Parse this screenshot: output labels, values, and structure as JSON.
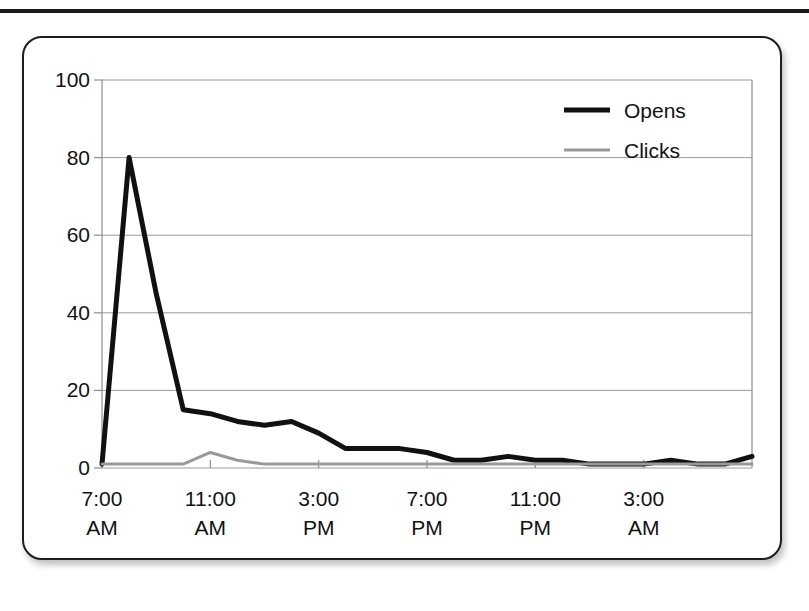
{
  "card": {
    "title": ""
  },
  "legend": {
    "position": "top-right",
    "entries": [
      {
        "label": "Opens",
        "color": "#111111",
        "swatch": "line-swatch-opens"
      },
      {
        "label": "Clicks",
        "color": "#999999",
        "swatch": "line-swatch-clicks"
      }
    ]
  },
  "chart_data": {
    "type": "line",
    "title": "",
    "xlabel": "",
    "ylabel": "",
    "grid": true,
    "legend_position": "top-right",
    "ylim": [
      0,
      100
    ],
    "yticks": [
      0,
      20,
      40,
      60,
      80,
      100
    ],
    "ytick_labels": [
      "0",
      "20",
      "40",
      "60",
      "80",
      "100"
    ],
    "xtick_labels": [
      "7:00\nAM",
      "11:00\nAM",
      "3:00\nPM",
      "7:00\nPM",
      "11:00\nPM",
      "3:00\nAM"
    ],
    "xtick_times": [
      "7:00 AM",
      "11:00 AM",
      "3:00 PM",
      "7:00 PM",
      "11:00 PM",
      "3:00 AM"
    ],
    "xtick_hours": [
      7,
      11,
      15,
      19,
      23,
      27
    ],
    "xlim_hours": [
      7,
      31
    ],
    "x": [
      "7:00 AM",
      "8:00 AM",
      "9:00 AM",
      "10:00 AM",
      "11:00 AM",
      "12:00 PM",
      "1:00 PM",
      "2:00 PM",
      "3:00 PM",
      "4:00 PM",
      "5:00 PM",
      "6:00 PM",
      "7:00 PM",
      "8:00 PM",
      "9:00 PM",
      "10:00 PM",
      "11:00 PM",
      "12:00 AM",
      "1:00 AM",
      "2:00 AM",
      "3:00 AM",
      "4:00 AM",
      "5:00 AM",
      "6:00 AM",
      "7:00 AM"
    ],
    "series": [
      {
        "name": "Opens",
        "color": "#111111",
        "width": 5,
        "values": [
          1,
          80,
          45,
          15,
          14,
          12,
          11,
          12,
          9,
          5,
          5,
          5,
          4,
          2,
          2,
          3,
          2,
          2,
          1,
          1,
          1,
          2,
          1,
          1,
          3
        ]
      },
      {
        "name": "Clicks",
        "color": "#999999",
        "width": 3,
        "values": [
          1,
          1,
          1,
          1,
          4,
          2,
          1,
          1,
          1,
          1,
          1,
          1,
          1,
          1,
          1,
          1,
          1,
          1,
          1,
          1,
          1,
          1,
          1,
          1,
          1
        ]
      }
    ]
  },
  "geometry": {
    "plot_left": 78,
    "plot_right": 728,
    "plot_top": 42,
    "plot_bottom": 430
  }
}
